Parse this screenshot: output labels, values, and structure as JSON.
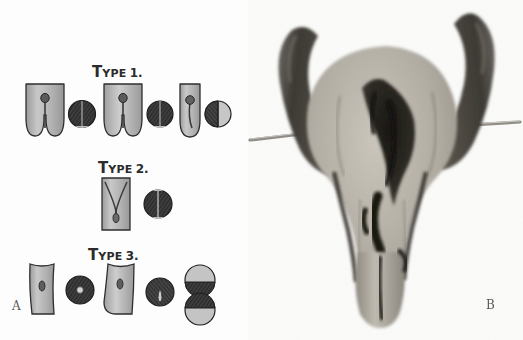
{
  "figure": {
    "background_color": "#ffffff",
    "panels": [
      {
        "letter": "A",
        "kind": "schematic-diagrams"
      },
      {
        "letter": "B",
        "kind": "specimen-photograph"
      }
    ]
  },
  "panel_a": {
    "letter": "A",
    "tissue_color": "#a9a9a9",
    "tissue_highlight": "#cfcfcf",
    "outline_color": "#2f2f2f",
    "section_dark": "#3f3f3f",
    "section_hatch": "#1d1d1d",
    "rows": [
      {
        "id": "type-1",
        "label": {
          "lead": "T",
          "rest": "YPE",
          "number": "1."
        },
        "units": [
          {
            "id": "type1-a-longitudinal",
            "form": "bifid-deep-cleft",
            "lobes": 2
          },
          {
            "id": "type1-a-section",
            "form": "section-full-dark-two-lobes"
          },
          {
            "id": "type1-b-longitudinal",
            "form": "bifid-deep-cleft",
            "lobes": 2
          },
          {
            "id": "type1-b-section",
            "form": "section-full-dark-two-lobes"
          },
          {
            "id": "type1-c-longitudinal",
            "form": "single-shallow-cleft",
            "lobes": 1
          },
          {
            "id": "type1-c-section",
            "form": "section-half-dark-half-light"
          }
        ]
      },
      {
        "id": "type-2",
        "label": {
          "lead": "T",
          "rest": "YPE",
          "number": "2."
        },
        "units": [
          {
            "id": "type2-a-longitudinal",
            "form": "v-shaped-internal-septum",
            "lobes": 1
          },
          {
            "id": "type2-a-section",
            "form": "section-full-dark-two-lobes"
          }
        ]
      },
      {
        "id": "type-3",
        "label": {
          "lead": "T",
          "rest": "YPE",
          "number": "3."
        },
        "units": [
          {
            "id": "type3-a-longitudinal",
            "form": "tube-small-lumen",
            "lobes": 1
          },
          {
            "id": "type3-a-section",
            "form": "section-dark-central-dot"
          },
          {
            "id": "type3-b-longitudinal",
            "form": "tube-flared-lumen",
            "lobes": 1
          },
          {
            "id": "type3-b-section",
            "form": "section-dark-teardrop-lumen"
          },
          {
            "id": "type3-c-section-pair",
            "form": "two-stacked-split-circles"
          }
        ]
      }
    ]
  },
  "panel_b": {
    "letter": "B",
    "description": "grayscale anatomical specimen photograph",
    "features": [
      {
        "id": "left-horn",
        "tone": "#4a4a4a"
      },
      {
        "id": "right-horn",
        "tone": "#4a4a4a"
      },
      {
        "id": "body",
        "tone": "#b4b0a8"
      },
      {
        "id": "central-cavity",
        "tone": "#2a2724"
      },
      {
        "id": "lower-canal",
        "tone": "#b4b0a8"
      },
      {
        "id": "left-probe",
        "tone": "#9a9a9a"
      },
      {
        "id": "right-probe",
        "tone": "#9a9a9a"
      }
    ]
  }
}
